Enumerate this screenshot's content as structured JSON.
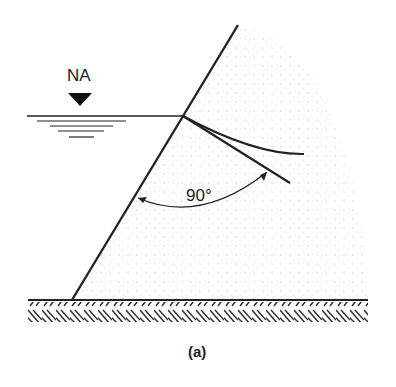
{
  "diagram": {
    "water_level_label": "NA",
    "angle_label": "90°",
    "caption": "(a)",
    "colors": {
      "line": "#222222",
      "fill_dots": "#c8c8c8"
    }
  }
}
